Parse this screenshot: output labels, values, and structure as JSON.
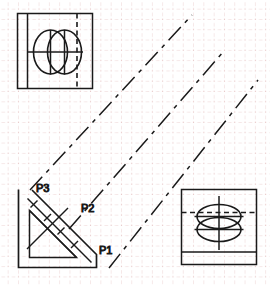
{
  "drawing": {
    "title": "Isometric projection construction drawing",
    "canvas": {
      "width": 270,
      "height": 285
    },
    "background_color": "#ffffff",
    "line_color": "#1a1a1a",
    "grid": {
      "visible": true,
      "dot_color": "#e8c8c8",
      "spacing": 10.3,
      "style": "dot-grid"
    },
    "labels": [
      {
        "id": "p3",
        "text": "P3",
        "x": 36,
        "y": 192
      },
      {
        "id": "p2",
        "text": "P2",
        "x": 81,
        "y": 212
      },
      {
        "id": "p1",
        "text": "P1",
        "x": 99,
        "y": 254
      }
    ],
    "views": {
      "top_left": {
        "name": "top-left-orthographic-view",
        "outline": {
          "x": 17,
          "y": 13,
          "width": 76,
          "height": 76
        },
        "description": "Square view with vertical edge line, vertical hidden dashed line, horizontal centerline and two overlapping ellipses"
      },
      "bottom_left": {
        "name": "bottom-left-chamfered-bracket-view",
        "description": "L-shaped bracket with 45 degree chamfer, inner triangle and section hatch leader strokes",
        "points_labelled": [
          "P1",
          "P2",
          "P3"
        ]
      },
      "bottom_right": {
        "name": "bottom-right-orthographic-view",
        "outline": {
          "x": 181,
          "y": 189,
          "width": 76,
          "height": 76
        },
        "description": "Square view with horizontal hidden dashed line, horizontal centerlines, vertical centerline, two overlapping ellipses and lower horizontal edge"
      }
    },
    "projection_lines": {
      "name": "projection-lines",
      "count": 3,
      "angle_degrees": 45,
      "style": "dash-dot",
      "description": "Three parallel 45 degree dash-dot construction lines linking the views"
    }
  }
}
